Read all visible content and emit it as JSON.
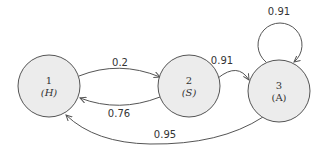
{
  "diagram": {
    "type": "state-transition",
    "nodes": [
      {
        "id": "1",
        "label": "1",
        "sublabel": "(H)"
      },
      {
        "id": "2",
        "label": "2",
        "sublabel": "(S)"
      },
      {
        "id": "3",
        "label": "3",
        "sublabel": "(A)"
      }
    ],
    "edges": [
      {
        "from": "1",
        "to": "2",
        "label": "0.2"
      },
      {
        "from": "2",
        "to": "1",
        "label": "0.76"
      },
      {
        "from": "2",
        "to": "3",
        "label": "0.91"
      },
      {
        "from": "3",
        "to": "3",
        "label": "0.91"
      },
      {
        "from": "3",
        "to": "1",
        "label": "0.95"
      }
    ]
  }
}
